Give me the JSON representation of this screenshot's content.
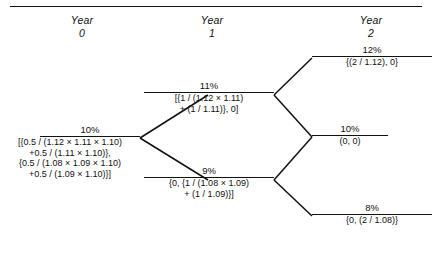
{
  "figure": {
    "type": "binomial-interest-rate-lattice",
    "columns": [
      {
        "line1": "Year",
        "line2": "0"
      },
      {
        "line1": "Year",
        "line2": "1"
      },
      {
        "line1": "Year",
        "line2": "2"
      }
    ]
  },
  "nodes": {
    "year0": {
      "rate": "10%",
      "payoff_lines": [
        "[{0.5 / (1.12 × 1.11 × 1.10)",
        "+0.5 / (1.11 × 1.10)},",
        "{0.5 / (1.08 × 1.09 × 1.10)",
        "+0.5 / (1.09 × 1.10)}]"
      ]
    },
    "year1_up": {
      "rate": "11%",
      "payoff_lines": [
        "[{1 / (1.12 × 1.11)",
        "+ (1 / 1.11)}, 0]"
      ]
    },
    "year1_down": {
      "rate": "9%",
      "payoff_lines": [
        "{0, {1 / (1.08 × 1.09)",
        "+ (1 / 1.09)}]"
      ]
    },
    "year2_a": {
      "rate": "12%",
      "payoff_lines": [
        "{(2 / 1.12), 0}"
      ]
    },
    "year2_b": {
      "rate": "10%",
      "payoff_lines": [
        "(0, 0)"
      ]
    },
    "year2_c": {
      "rate": "8%",
      "payoff_lines": [
        "{0, (2 / 1.08)}"
      ]
    }
  },
  "colors": {
    "ink": "#111111",
    "background": "#ffffff"
  }
}
